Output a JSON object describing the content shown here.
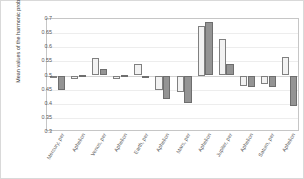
{
  "chart_data": {
    "type": "bar",
    "title": "",
    "xlabel": "",
    "ylabel": "Mean values of the harmonic probabilities",
    "ylim": [
      0.3,
      0.7
    ],
    "yticks": [
      "0.7",
      "0.65",
      "0.6",
      "0.55",
      "0.5",
      "0.45",
      "0.4",
      "0.35",
      "0.3"
    ],
    "ytick_values": [
      0.7,
      0.65,
      0.6,
      0.55,
      0.5,
      0.45,
      0.4,
      0.35,
      0.3
    ],
    "grid": true,
    "legend": "none",
    "baseline": 0.5,
    "categories": [
      "Mercury, per",
      "Aphelion",
      "Venus, per",
      "Aphelion",
      "Earth, per",
      "Aphelion",
      "Mars, per",
      "Aphelion",
      "Jupiter, per",
      "Aphelion",
      "Saturn, per",
      "Aphelion"
    ],
    "series": [
      {
        "name": "Series 1",
        "color": "#f2f2f2",
        "values": [
          0.492,
          0.489,
          0.563,
          0.488,
          0.541,
          0.447,
          0.441,
          0.677,
          0.63,
          0.463,
          0.469,
          0.567
        ]
      },
      {
        "name": "Series 2",
        "color": "#949494",
        "values": [
          0.447,
          0.503,
          0.524,
          0.503,
          0.497,
          0.418,
          0.403,
          0.688,
          0.539,
          0.458,
          0.461,
          0.393
        ]
      }
    ]
  }
}
